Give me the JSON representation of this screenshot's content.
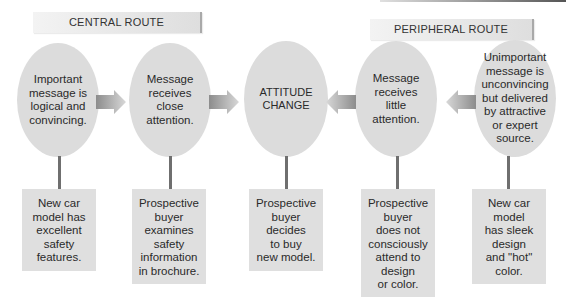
{
  "routes": {
    "central": {
      "label": "CENTRAL ROUTE"
    },
    "peripheral": {
      "label": "PERIPHERAL ROUTE"
    }
  },
  "nodes": [
    {
      "id": "central-1",
      "text": "Important\nmessage is\nlogical and\nconvincing."
    },
    {
      "id": "central-2",
      "text": "Message\nreceives\nclose\nattention."
    },
    {
      "id": "outcome",
      "text": "ATTITUDE\nCHANGE"
    },
    {
      "id": "peripheral-2",
      "text": "Message\nreceives\nlittle\nattention."
    },
    {
      "id": "peripheral-1",
      "text": "Unimportant\nmessage is\nunconvincing\nbut delivered\nby attractive\nor expert\nsource."
    }
  ],
  "examples": [
    {
      "text": "New car\nmodel has\nexcellent\nsafety\nfeatures."
    },
    {
      "text": "Prospective\nbuyer\nexamines\nsafety\ninformation\nin brochure."
    },
    {
      "text": "Prospective\nbuyer\ndecides\nto buy\nnew model."
    },
    {
      "text": "Prospective\nbuyer\ndoes not\nconsciously\nattend to\ndesign\nor color."
    },
    {
      "text": "New car\nmodel\nhas sleek\ndesign\nand \"hot\"\ncolor."
    }
  ],
  "arrows": [
    {
      "from": "central-1",
      "to": "central-2",
      "direction": "right"
    },
    {
      "from": "central-2",
      "to": "outcome",
      "direction": "right"
    },
    {
      "from": "peripheral-2",
      "to": "outcome",
      "direction": "left"
    },
    {
      "from": "peripheral-1",
      "to": "peripheral-2",
      "direction": "left"
    }
  ],
  "colors": {
    "node_fill": "#dcdcdc",
    "box_fill": "#dfdfdf",
    "stem": "#6f6f6f",
    "arrow_dark": "#8c8c8c",
    "arrow_light": "#d8d8d8"
  }
}
